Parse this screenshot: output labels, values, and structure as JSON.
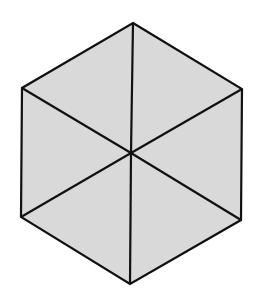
{
  "diagram": {
    "title": "",
    "shape": "regular-hexagon-divided-into-six-triangles",
    "canvas": {
      "width": 253,
      "height": 301,
      "background": "#ffffff"
    },
    "colors": {
      "fill": "#d9d9d9",
      "stroke": "#111111"
    },
    "stroke_width": 2.2,
    "center": {
      "x": 131,
      "y": 153
    },
    "vertices": [
      {
        "name": "top",
        "x": 133,
        "y": 23
      },
      {
        "name": "upper-right",
        "x": 242,
        "y": 89
      },
      {
        "name": "lower-right",
        "x": 241,
        "y": 220
      },
      {
        "name": "bottom",
        "x": 130,
        "y": 284
      },
      {
        "name": "lower-left",
        "x": 21,
        "y": 217
      },
      {
        "name": "upper-left",
        "x": 22,
        "y": 88
      }
    ],
    "triangle_count": 6
  }
}
